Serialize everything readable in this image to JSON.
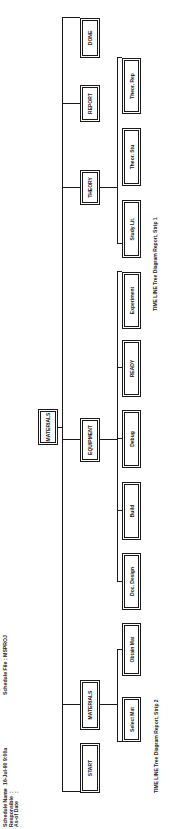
{
  "header": {
    "fields": [
      {
        "label": "Schedule Name",
        "sep": ":",
        "value": "16-Jul-90   9:00a"
      },
      {
        "label": "Responsible",
        "sep": ":",
        "value": ""
      },
      {
        "label": "As-of Date",
        "sep": ":",
        "value": ""
      }
    ],
    "schedule_file_label": "Schedule File :",
    "schedule_file_value": "MSPROJ"
  },
  "tree": {
    "root": {
      "label": "MATERIALS"
    },
    "level1": [
      {
        "label": "START"
      },
      {
        "label": "MATERIALS"
      },
      {
        "label": "EQUIPMENT"
      },
      {
        "label": "THEORY"
      },
      {
        "label": "REPORT"
      },
      {
        "label": "DONE"
      }
    ],
    "level2": [
      {
        "label": "Select Mat",
        "parent": "MATERIALS"
      },
      {
        "label": "Obtain Mat",
        "parent": "MATERIALS"
      },
      {
        "label": "Doc. Design",
        "parent": "EQUIPMENT"
      },
      {
        "label": "Build",
        "parent": "EQUIPMENT"
      },
      {
        "label": "Debug",
        "parent": "EQUIPMENT"
      },
      {
        "label": "READY",
        "parent": "EQUIPMENT"
      },
      {
        "label": "Experiment",
        "parent": "EQUIPMENT"
      },
      {
        "label": "Study Lit.",
        "parent": "THEORY"
      },
      {
        "label": "Theor. Stu",
        "parent": "THEORY"
      },
      {
        "label": "Theor. Rep",
        "parent": "THEORY"
      }
    ]
  },
  "captions": {
    "strip2": "TIME LINE Tree Diagram Report, Strip 2",
    "strip1": "TIME LINE Tree Diagram Report, Strip 1"
  },
  "colors": {
    "ink": "#1a1a1a",
    "paper": "#ffffff"
  }
}
